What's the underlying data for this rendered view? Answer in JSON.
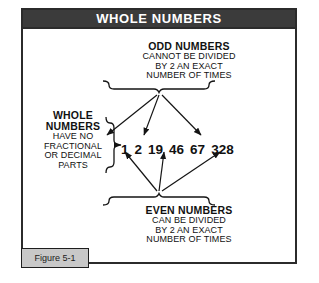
{
  "figure": {
    "title": "WHOLE NUMBERS",
    "caption": "Figure 5-1",
    "colors": {
      "title_bar_bg": "#3b3b3b",
      "title_text": "#ffffff",
      "frame_border": "#2b2b2b",
      "canvas_bg": "#ffffff",
      "text": "#111111",
      "caption_bg": "#c8c8c8",
      "caption_border": "#1e1e1e"
    }
  },
  "odd_group": {
    "heading": "ODD NUMBERS",
    "lines": [
      "CANNOT BE DIVIDED",
      "BY 2 AN EXACT",
      "NUMBER OF TIMES"
    ],
    "brace": "downward-brace",
    "points_to": [
      "1",
      "19",
      "67"
    ]
  },
  "even_group": {
    "heading": "EVEN NUMBERS",
    "lines": [
      "CAN BE DIVIDED",
      "BY 2 AN EXACT",
      "NUMBER OF TIMES"
    ],
    "brace": "upward-brace",
    "points_to": [
      "2",
      "46",
      "328"
    ]
  },
  "whole_group": {
    "heading_line_1": "WHOLE",
    "heading_line_2": "NUMBERS",
    "lines": [
      "HAVE NO",
      "FRACTIONAL",
      "OR DECIMAL",
      "PARTS"
    ],
    "brace": "right-brace",
    "points_to": "all"
  },
  "numbers": [
    {
      "value": "1",
      "parity": "odd"
    },
    {
      "value": "2",
      "parity": "even"
    },
    {
      "value": "19",
      "parity": "odd"
    },
    {
      "value": "46",
      "parity": "even"
    },
    {
      "value": "67",
      "parity": "odd"
    },
    {
      "value": "328",
      "parity": "even"
    }
  ]
}
